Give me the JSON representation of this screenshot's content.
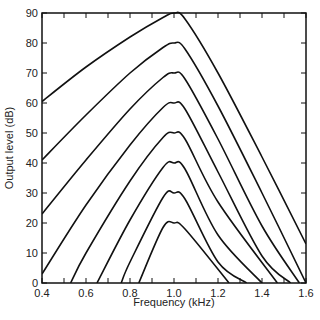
{
  "chart_data": {
    "type": "line",
    "title": "",
    "xlabel": "Frequency (kHz)",
    "ylabel": "Output level (dB)",
    "xlim": [
      0.4,
      1.6
    ],
    "ylim": [
      0,
      90
    ],
    "xticks": [
      0.4,
      0.6,
      0.8,
      1.0,
      1.2,
      1.4,
      1.6
    ],
    "xtick_labels": [
      "0.4",
      "0.6",
      "0.8",
      "1.0",
      "1.2",
      "1.4",
      "1.6"
    ],
    "yticks": [
      0,
      10,
      20,
      30,
      40,
      50,
      60,
      70,
      80,
      90
    ],
    "ytick_labels": [
      "0",
      "10",
      "20",
      "30",
      "40",
      "50",
      "60",
      "70",
      "80",
      "90"
    ],
    "grid": false,
    "legend": null,
    "series": [
      {
        "name": "peak 90 dB",
        "x": [
          0.4,
          0.6,
          0.8,
          0.95,
          1.0,
          1.05,
          1.2,
          1.4,
          1.6
        ],
        "y": [
          60.5,
          72,
          82,
          88.5,
          90,
          88,
          70,
          42,
          13
        ]
      },
      {
        "name": "peak 80 dB",
        "x": [
          0.4,
          0.6,
          0.8,
          0.95,
          1.0,
          1.05,
          1.2,
          1.4,
          1.6
        ],
        "y": [
          41,
          56,
          70,
          78.5,
          80,
          78,
          59,
          30,
          0
        ]
      },
      {
        "name": "peak 70 dB",
        "x": [
          0.4,
          0.6,
          0.8,
          0.95,
          1.0,
          1.05,
          1.2,
          1.4,
          1.57
        ],
        "y": [
          23,
          41,
          58,
          68.5,
          70,
          68,
          48,
          19,
          0
        ]
      },
      {
        "name": "peak 60 dB",
        "x": [
          0.4,
          0.6,
          0.8,
          0.95,
          1.0,
          1.05,
          1.2,
          1.4,
          1.53
        ],
        "y": [
          3,
          26,
          46,
          58.5,
          60,
          58,
          37,
          9,
          0
        ]
      },
      {
        "name": "peak 50 dB",
        "x": [
          0.53,
          0.6,
          0.8,
          0.95,
          1.0,
          1.05,
          1.2,
          1.47
        ],
        "y": [
          0,
          10,
          34,
          48.5,
          50,
          48,
          27,
          0
        ]
      },
      {
        "name": "peak 40 dB",
        "x": [
          0.65,
          0.8,
          0.95,
          1.0,
          1.05,
          1.2,
          1.4
        ],
        "y": [
          0,
          21,
          38.5,
          40,
          38,
          16,
          0
        ]
      },
      {
        "name": "peak 30 dB",
        "x": [
          0.76,
          0.8,
          0.95,
          1.0,
          1.05,
          1.2,
          1.33
        ],
        "y": [
          0,
          7,
          28.5,
          30,
          28,
          7,
          0
        ]
      },
      {
        "name": "peak 20 dB",
        "x": [
          0.84,
          0.95,
          1.0,
          1.05,
          1.25
        ],
        "y": [
          0,
          18.5,
          20,
          18,
          0
        ]
      }
    ]
  }
}
